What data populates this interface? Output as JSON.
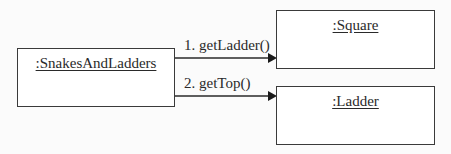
{
  "diagram": {
    "type": "UML communication diagram",
    "objects": [
      {
        "id": "snakes",
        "label": ":SnakesAndLadders"
      },
      {
        "id": "square",
        "label": ":Square"
      },
      {
        "id": "ladder",
        "label": ":Ladder"
      }
    ],
    "messages": [
      {
        "label": "1. getLadder()",
        "from": "snakes",
        "to": "square"
      },
      {
        "label": "2. getTop()",
        "from": "snakes",
        "to": "ladder"
      }
    ],
    "colors": {
      "line": "#2a2a2a",
      "background": "#fbfbfb"
    }
  }
}
